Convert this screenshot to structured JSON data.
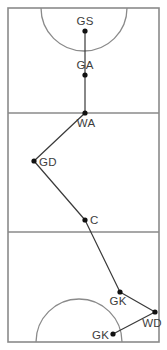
{
  "diagram": {
    "colors": {
      "court_line": "#8a8a8a",
      "path_line": "#3a3a3a",
      "node_fill": "#111111",
      "label_text": "#3d3d3d",
      "background": "#ffffff"
    },
    "court": {
      "outline": {
        "x": 8,
        "y": 8,
        "width": 151,
        "height": 334
      },
      "third_lines_y": [
        113,
        232
      ],
      "goal_circles": [
        {
          "name": "top-goal-circle",
          "center_x": 84,
          "center_y": 8,
          "radius": 43,
          "opens": "down"
        },
        {
          "name": "bottom-goal-circle",
          "center_x": 79,
          "center_y": 342,
          "radius": 43,
          "opens": "up"
        }
      ]
    },
    "path": {
      "polyline": "85,31 85,75 85,113 34,161 85,220 120,292 155,312 113,334",
      "segments": [
        {
          "from": "GS",
          "to": "GA",
          "points": "85,31 85,75"
        },
        {
          "from": "GA",
          "to": "WA",
          "points": "85,75 85,113"
        },
        {
          "from": "WA",
          "to": "GD",
          "points": "85,113 34,161"
        },
        {
          "from": "GD",
          "to": "C",
          "points": "34,161 85,220"
        },
        {
          "from": "C",
          "to": "GK",
          "points": "85,220 120,292"
        },
        {
          "from": "GK",
          "to": "WD",
          "points": "120,292 155,312"
        },
        {
          "from": "WD",
          "to": "GK2",
          "points": "155,312 113,334"
        }
      ]
    },
    "nodes": [
      {
        "id": "GS",
        "label": "GS",
        "x": 85,
        "y": 31,
        "label_x": 85,
        "label_y": 25,
        "anchor": "middle"
      },
      {
        "id": "GA",
        "label": "GA",
        "x": 85,
        "y": 75,
        "label_x": 85,
        "label_y": 69,
        "anchor": "middle"
      },
      {
        "id": "WA",
        "label": "WA",
        "x": 85,
        "y": 113,
        "label_x": 86,
        "label_y": 127,
        "anchor": "middle"
      },
      {
        "id": "GD",
        "label": "GD",
        "x": 34,
        "y": 161,
        "label_x": 39,
        "label_y": 166,
        "anchor": "start"
      },
      {
        "id": "C",
        "label": "C",
        "x": 85,
        "y": 220,
        "label_x": 90,
        "label_y": 224,
        "anchor": "start"
      },
      {
        "id": "GK1",
        "label": "GK",
        "x": 120,
        "y": 292,
        "label_x": 118,
        "label_y": 305,
        "anchor": "middle"
      },
      {
        "id": "WD",
        "label": "WD",
        "x": 155,
        "y": 312,
        "label_x": 152,
        "label_y": 327,
        "anchor": "middle"
      },
      {
        "id": "GK2",
        "label": "GK",
        "x": 113,
        "y": 334,
        "label_x": 109,
        "label_y": 339,
        "anchor": "end"
      }
    ]
  }
}
